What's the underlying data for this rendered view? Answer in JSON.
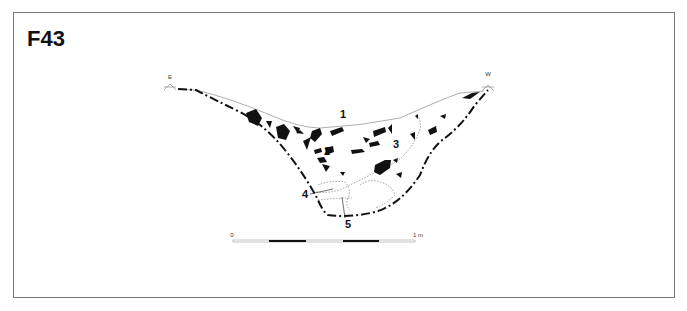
{
  "figure": {
    "id": "F43",
    "orientation": {
      "left": "E",
      "right": "W"
    },
    "layers": [
      {
        "number": "1"
      },
      {
        "number": "2"
      },
      {
        "number": "3"
      },
      {
        "number": "4"
      },
      {
        "number": "5"
      }
    ],
    "scale_bar": {
      "start_label": "0",
      "end_label": "1 m"
    },
    "colors": {
      "ink": "#111111",
      "frame": "#777777",
      "surface": "#999999"
    }
  }
}
